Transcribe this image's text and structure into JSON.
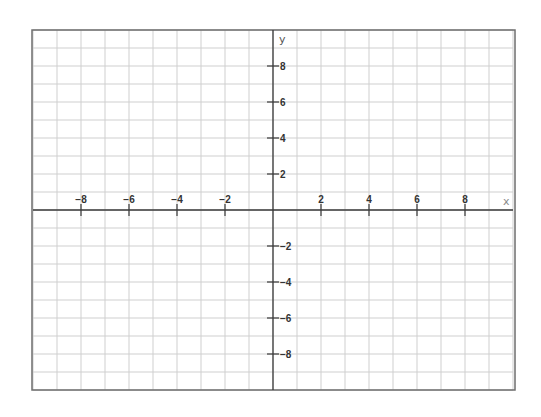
{
  "chart_data": {
    "type": "scatter",
    "title": "",
    "xlabel": "x",
    "ylabel": "y",
    "xlim": [
      -10,
      10
    ],
    "ylim": [
      -10,
      10
    ],
    "grid": true,
    "grid_step": 1,
    "x_ticks": [
      -8,
      -6,
      -4,
      -2,
      2,
      4,
      6,
      8
    ],
    "y_ticks": [
      8,
      6,
      4,
      2,
      -2,
      -4,
      -6,
      -8
    ],
    "x_tick_labels": [
      "−8",
      "−6",
      "−4",
      "−2",
      "2",
      "4",
      "6",
      "8"
    ],
    "y_tick_labels": [
      "8",
      "6",
      "4",
      "2",
      "−2",
      "−4",
      "−6",
      "−8"
    ],
    "series": [],
    "legend": null
  },
  "layout": {
    "origin_px": [
      273,
      210
    ],
    "unit_x_px": 24,
    "unit_y_px": 18,
    "colors": {
      "grid": "#cfcfcf",
      "border": "#6e6e6e",
      "axis": "#3a3a3a",
      "label": "#333333"
    }
  }
}
